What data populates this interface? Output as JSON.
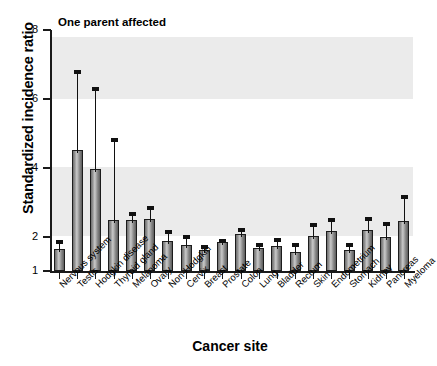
{
  "chart_data": {
    "type": "bar",
    "title": "One parent affected",
    "xlabel": "Cancer site",
    "ylabel": "Standardized incidence ratio",
    "ylim": [
      1,
      8
    ],
    "yticks": [
      1,
      2,
      4,
      6,
      8
    ],
    "ytick_labels": [
      "1",
      "2",
      "4",
      "6",
      "8"
    ],
    "grid": false,
    "legend": "none",
    "shaded_bands": [
      [
        6.0,
        7.8
      ],
      [
        2.0,
        4.0
      ]
    ],
    "categories": [
      "Nervous system",
      "Testis",
      "Hodgkin disease",
      "Thyroid gland",
      "Melanoma",
      "Ovary",
      "Non-Hodgkin",
      "Cervix",
      "Breast",
      "Prostate",
      "Colon",
      "Lung",
      "Bladder",
      "Rectum",
      "Skin",
      "Endometrium",
      "Stomach",
      "Kidney",
      "Pancreas",
      "Myeloma"
    ],
    "values": [
      1.65,
      4.52,
      3.97,
      2.48,
      2.47,
      2.5,
      1.86,
      1.76,
      1.62,
      1.83,
      2.07,
      1.68,
      1.73,
      1.55,
      2.01,
      2.16,
      1.62,
      2.2,
      1.98,
      2.44
    ],
    "error_high": [
      1.9,
      6.83,
      6.35,
      4.85,
      2.72,
      2.9,
      2.18,
      2.05,
      1.76,
      1.93,
      2.25,
      1.82,
      1.95,
      1.82,
      2.4,
      2.53,
      1.82,
      2.58,
      2.42,
      3.22
    ],
    "series": [
      {
        "name": "Standardized incidence ratio",
        "values": [
          1.65,
          4.52,
          3.97,
          2.48,
          2.47,
          2.5,
          1.86,
          1.76,
          1.62,
          1.83,
          2.07,
          1.68,
          1.73,
          1.55,
          2.01,
          2.16,
          1.62,
          2.2,
          1.98,
          2.44
        ]
      }
    ]
  },
  "chart": {
    "title": "One parent affected",
    "xlabel": "Cancer site",
    "ylabel": "Standardized incidence ratio"
  }
}
